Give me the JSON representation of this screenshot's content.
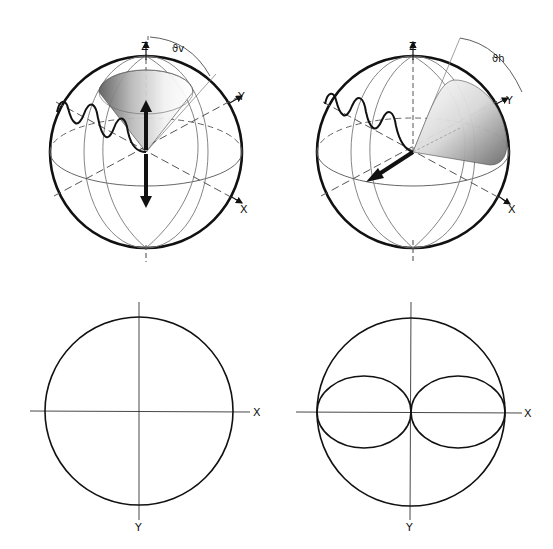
{
  "figure": {
    "panels": [
      {
        "id": "vertical-dipole-sphere",
        "axis_labels": {
          "z": "Z",
          "y": "Y",
          "x": "X"
        },
        "angle_label": "ϑv",
        "description": "Sphere with vertical dipole (arrow along Z) and emission cone around Z, incoming wavy light ray"
      },
      {
        "id": "horizontal-dipole-sphere",
        "axis_labels": {
          "z": "Z",
          "y": "Y",
          "x": "X"
        },
        "angle_label": "ϑh",
        "description": "Sphere with horizontal dipole (arrow along X) and emission cone tilted toward Y, incoming wavy light ray"
      },
      {
        "id": "vertical-projection",
        "axis_labels": {
          "x": "X",
          "y": "Y"
        },
        "description": "Circular projection in XY plane"
      },
      {
        "id": "horizontal-projection",
        "axis_labels": {
          "x": "X",
          "y": "Y"
        },
        "description": "Circle with figure-eight (two lobes) along X axis"
      }
    ]
  },
  "colors": {
    "stroke": "#111111",
    "thin_stroke": "#555555",
    "background": "#ffffff"
  }
}
